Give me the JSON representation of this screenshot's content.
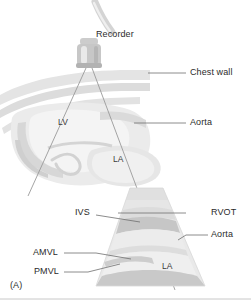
{
  "figure": {
    "panel_letter": "(A)",
    "caption_labels": {
      "recorder": "Recorder",
      "chest_wall": "Chest wall",
      "aorta_top": "Aorta",
      "lv": "LV",
      "la_top": "LA",
      "ivs": "IVS",
      "rvot": "RVOT",
      "aorta_bottom": "Aorta",
      "amvl": "AMVL",
      "pmvl": "PMVL",
      "la_bottom": "LA"
    },
    "colors": {
      "background": "#ffffff",
      "text": "#2b2b2b",
      "leader_line": "#6e6e6e",
      "probe_body": "#c9c9c9",
      "probe_highlight": "#ececec",
      "cable": "#d0d0d0",
      "beam_line": "#9a9a9a",
      "anatomy_light": "#ededed",
      "anatomy_mid": "#dedede",
      "anatomy_dark": "#cfcfcf",
      "sector_fill": "#e8e8e8",
      "sector_band": "#d2d2d2",
      "sector_shadow": "#c4c4c4",
      "border_rule": "#c8c8c8"
    }
  }
}
